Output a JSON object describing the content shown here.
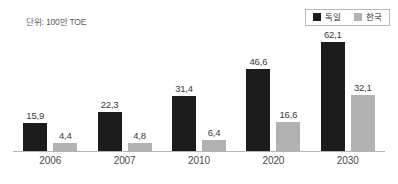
{
  "caption": {
    "unit_label": "단위: 100만 TOE"
  },
  "legend": {
    "position": "top-right",
    "entries": [
      {
        "label": "독일",
        "color": "#1c1c1c",
        "swatch_icon": "legend-swatch-filled-square"
      },
      {
        "label": "한국",
        "color": "#b2b2b2",
        "swatch_icon": "legend-swatch-filled-square"
      }
    ]
  },
  "chart_data": {
    "type": "bar",
    "title": "",
    "subtitle": "",
    "xlabel": "",
    "ylabel": "",
    "annotations": [
      "단위: 100만 TOE"
    ],
    "grid": false,
    "legend_position": "top-right",
    "ylim": [
      0,
      68
    ],
    "categories": [
      "2006",
      "2007",
      "2010",
      "2020",
      "2030"
    ],
    "series": [
      {
        "name": "독일",
        "color": "#1c1c1c",
        "values": [
          15.9,
          22.3,
          31.4,
          46.6,
          62.1
        ],
        "labels": [
          "15,9",
          "22,3",
          "31,4",
          "46,6",
          "62,1"
        ]
      },
      {
        "name": "한국",
        "color": "#b2b2b2",
        "values": [
          4.4,
          4.8,
          6.4,
          16.6,
          32.1
        ],
        "labels": [
          "4,4",
          "4,8",
          "6,4",
          "16,6",
          "32,1"
        ]
      }
    ]
  }
}
